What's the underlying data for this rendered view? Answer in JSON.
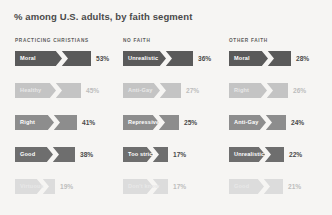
{
  "title": "% among U.S. adults, by faith segment",
  "colors": {
    "background": "#f6f5f3",
    "title_text": "#4a4a4a",
    "header_text": "#5c5c5c",
    "notch": "#f6f5f3",
    "tone_1": "#5a5a5a",
    "tone_2": "#c4c4c4",
    "tone_3": "#8d8d8d",
    "tone_4": "#6e6e6e",
    "tone_5": "#dcdcdc",
    "label_on_dark": "#ffffff",
    "label_on_light": "#e8e8e8",
    "value_dark": "#4a4a4a",
    "value_light": "#bdbdbd"
  },
  "chart_data": {
    "type": "bar",
    "title": "% among U.S. adults, by faith segment",
    "xlabel": "",
    "ylabel": "",
    "grid": false,
    "legend": "none",
    "orientation": "horizontal",
    "value_suffix": "%",
    "groups": [
      {
        "name": "PRACTICING CHRISTIANS",
        "categories": [
          "Moral",
          "Healthy",
          "Right",
          "Good",
          "Virtuous"
        ],
        "values": [
          53,
          45,
          41,
          38,
          19
        ],
        "value_labels": [
          "53%",
          "45%",
          "41%",
          "38%",
          "19%"
        ]
      },
      {
        "name": "NO FAITH",
        "categories": [
          "Unrealistic",
          "Anti-Gay",
          "Repressive",
          "Too strict",
          "Don't know"
        ],
        "values": [
          36,
          27,
          25,
          17,
          17
        ],
        "value_labels": [
          "36%",
          "27%",
          "25%",
          "17%",
          "17%"
        ]
      },
      {
        "name": "OTHER FAITH",
        "categories": [
          "Moral",
          "Right",
          "Anti-Gay",
          "Unrealistic",
          "Good"
        ],
        "values": [
          28,
          26,
          24,
          22,
          21
        ],
        "value_labels": [
          "28%",
          "26%",
          "24%",
          "22%",
          "21%"
        ]
      }
    ]
  }
}
